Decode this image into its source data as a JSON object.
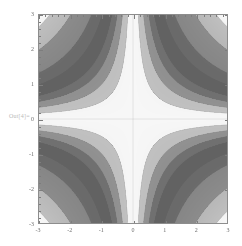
{
  "figure": {
    "out_prompt": "Out[4]=",
    "background_color": "#ffffff",
    "frame_color": "#8d8d8d",
    "plot_background": "#fafafa"
  },
  "chart_data": {
    "type": "heatmap",
    "title": "",
    "subtitle": "",
    "xlabel": "",
    "ylabel": "",
    "function": "x*y",
    "grid": false,
    "legend": null,
    "colormap": "grayscale",
    "colormap_light": "#f7f7f7",
    "colormap_dark": "#5a5a5a",
    "contour_line_color": "#707070",
    "xlim": [
      -3,
      3
    ],
    "ylim": [
      -3,
      3
    ],
    "x_major_ticks": [
      -3,
      -2,
      -1,
      0,
      1,
      2,
      3
    ],
    "y_major_ticks": [
      3,
      2,
      1,
      0,
      -1,
      -2,
      -3
    ],
    "x_tick_labels": [
      "-3",
      "-2",
      "-1",
      "0",
      "1",
      "2",
      "3"
    ],
    "y_tick_labels": [
      "3",
      "2",
      "1",
      "0",
      "-1",
      "-2",
      "-3"
    ],
    "x_minor_tick_step": 0.2,
    "y_minor_tick_step": 0.2,
    "contour_levels": [
      -8,
      -6,
      -4,
      -3,
      -2,
      -1.5,
      -1,
      -0.5,
      0,
      0.5,
      1,
      1.5,
      2,
      3,
      4,
      6,
      8
    ],
    "n_contour_bands": 16,
    "sample_points": [
      {
        "x": -3,
        "y": 3,
        "value": -9
      },
      {
        "x": -1.5,
        "y": 1.5,
        "value": -2.25
      },
      {
        "x": 0,
        "y": 0,
        "value": 0
      },
      {
        "x": 1.5,
        "y": 1.5,
        "value": 2.25
      },
      {
        "x": 3,
        "y": 3,
        "value": 9
      },
      {
        "x": -3,
        "y": -3,
        "value": 9
      },
      {
        "x": 3,
        "y": -3,
        "value": -9
      },
      {
        "x": 0,
        "y": 3,
        "value": 0
      },
      {
        "x": 3,
        "y": 0,
        "value": 0
      }
    ]
  }
}
